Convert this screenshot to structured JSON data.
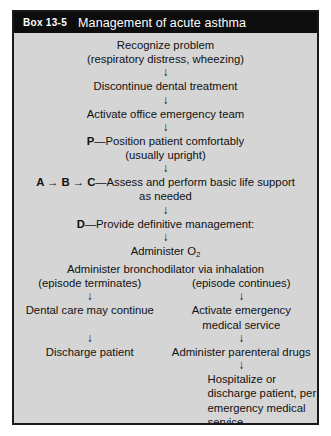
{
  "box": {
    "number": "Box 13-5",
    "title": "Management of acute asthma"
  },
  "icons": {
    "down_arrow": "↓",
    "right_arrow": "→"
  },
  "flow": {
    "stem": [
      {
        "text": "Recognize problem"
      },
      {
        "text": "(respiratory distress, wheezing)"
      },
      {
        "text": "Discontinue dental treatment"
      },
      {
        "text": "Activate office emergency team"
      },
      {
        "label": "P",
        "dash": "—",
        "text": "Position patient comfortably"
      },
      {
        "text": "(usually upright)"
      },
      {
        "abc": "A → B → C",
        "dash": "—",
        "text": "Assess and perform basic life support"
      },
      {
        "text": "as needed"
      },
      {
        "label": "D",
        "dash": "—",
        "text": "Provide definitive management:"
      },
      {
        "text": "Administer O",
        "sub": "2"
      },
      {
        "text": "Administer bronchodilator via inhalation"
      }
    ]
  },
  "branches": {
    "left": {
      "condition": "(episode terminates)",
      "steps": [
        "Dental care may continue",
        "Discharge patient"
      ]
    },
    "right": {
      "condition": "(episode continues)",
      "steps": [
        "Activate emergency",
        "medical service",
        "Administer parenteral drugs"
      ],
      "final": "Hospitalize or discharge patient, per emergency medical service recommendation"
    }
  }
}
